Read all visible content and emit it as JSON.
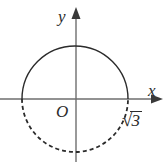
{
  "figure": {
    "type": "coordinate-plane-circle-diagram",
    "background_color": "#ffffff",
    "width": 167,
    "height": 162
  },
  "axes": {
    "x_label": "x",
    "y_label": "y",
    "origin_label": "O",
    "axis_color": "#6e6e6e",
    "origin": {
      "x": 76,
      "y": 99
    },
    "x_axis": {
      "x_start": 0,
      "x_end": 160,
      "y": 99,
      "arrow": "right"
    },
    "y_axis": {
      "y_start": 12,
      "y_end": 162,
      "x": 76,
      "arrow": "up"
    }
  },
  "curve": {
    "shape": "circle",
    "center": {
      "x": 75,
      "y": 99
    },
    "radius": 53,
    "color": "#2b2b2b",
    "upper_half_style": "solid",
    "lower_half_style": "dashed",
    "dash_pattern": "4 3",
    "stroke_width": 1.4
  },
  "annotations": {
    "x_intercept_label": {
      "radical": "√",
      "radicand": "3",
      "text": "√3"
    }
  }
}
